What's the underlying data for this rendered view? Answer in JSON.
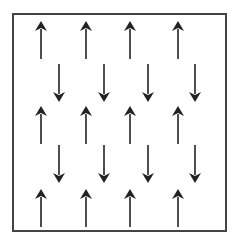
{
  "diagram": {
    "title": "",
    "colors": {
      "stroke": "#222222",
      "background": "#ffffff",
      "frame": "#444444"
    },
    "frame": {
      "x": 13,
      "y": 14,
      "width": 213,
      "height": 217
    },
    "rows": [
      {
        "direction": "up",
        "y_tail": 59,
        "y_tip": 21,
        "xs": [
          41,
          86,
          130,
          178
        ]
      },
      {
        "direction": "down",
        "y_tail": 64,
        "y_tip": 102,
        "xs": [
          59,
          104,
          148,
          195
        ]
      },
      {
        "direction": "up",
        "y_tail": 144,
        "y_tip": 106,
        "xs": [
          41,
          86,
          130,
          178
        ]
      },
      {
        "direction": "down",
        "y_tail": 145,
        "y_tip": 183,
        "xs": [
          59,
          104,
          148,
          195
        ]
      },
      {
        "direction": "up",
        "y_tail": 227,
        "y_tip": 189,
        "xs": [
          41,
          86,
          130,
          178
        ]
      }
    ],
    "counts": {
      "up_arrows": 12,
      "down_arrows": 8,
      "total": 20
    }
  }
}
